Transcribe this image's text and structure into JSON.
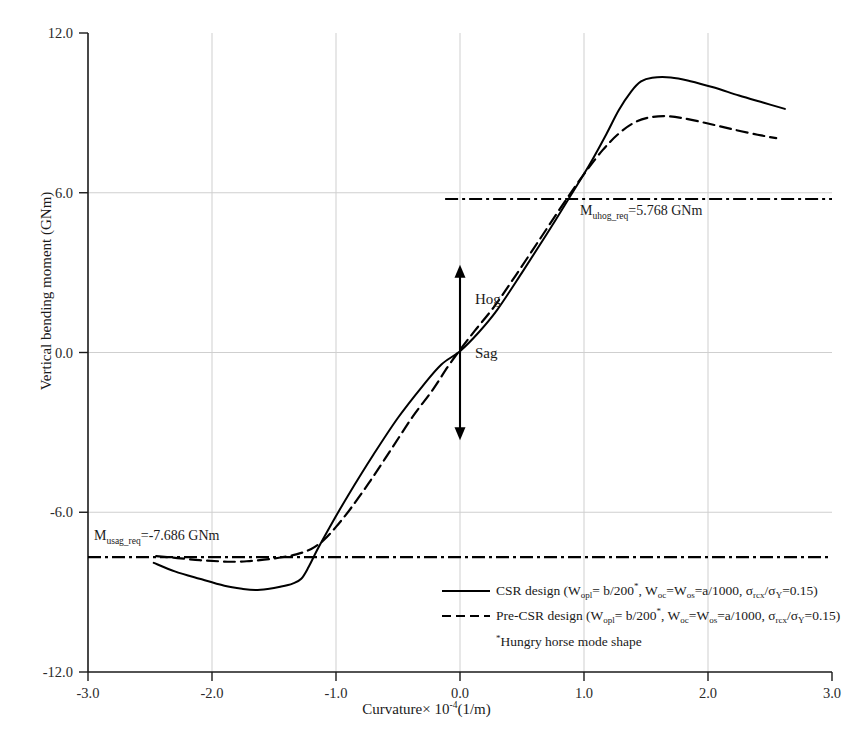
{
  "chart_data": {
    "type": "line",
    "title": "",
    "xlabel": "Curvature× 10⁻⁴(1/m)",
    "ylabel": "Vertical bending moment  (GNm)",
    "xlim": [
      -3.0,
      3.0
    ],
    "ylim": [
      -12.0,
      12.0
    ],
    "xticks": [
      -3.0,
      -2.0,
      -1.0,
      0.0,
      1.0,
      2.0,
      3.0
    ],
    "xticklabels": [
      "-3.0",
      "-2.0",
      "-1.0",
      "0.0",
      "1.0",
      "2.0",
      "3.0"
    ],
    "yticks": [
      12.0,
      6.0,
      0.0,
      -6.0,
      -12.0
    ],
    "yticklabels": [
      "12.0",
      "6.0",
      "0.0",
      "-6.0",
      "-12.0"
    ],
    "grid": true,
    "legend_position": "lower-right-inside",
    "series": [
      {
        "name": "CSR design",
        "style": "solid",
        "color": "#000000",
        "points": [
          [
            -2.47,
            -7.9
          ],
          [
            -2.3,
            -8.22
          ],
          [
            -2.1,
            -8.5
          ],
          [
            -1.9,
            -8.76
          ],
          [
            -1.75,
            -8.88
          ],
          [
            -1.65,
            -8.92
          ],
          [
            -1.55,
            -8.88
          ],
          [
            -1.45,
            -8.8
          ],
          [
            -1.35,
            -8.68
          ],
          [
            -1.28,
            -8.5
          ],
          [
            -1.22,
            -8.05
          ],
          [
            -1.15,
            -7.4
          ],
          [
            -1.05,
            -6.55
          ],
          [
            -0.9,
            -5.35
          ],
          [
            -0.7,
            -3.85
          ],
          [
            -0.5,
            -2.45
          ],
          [
            -0.3,
            -1.25
          ],
          [
            -0.15,
            -0.45
          ],
          [
            0.0,
            0.05
          ],
          [
            0.15,
            0.75
          ],
          [
            0.3,
            1.6
          ],
          [
            0.5,
            3.0
          ],
          [
            0.7,
            4.45
          ],
          [
            0.9,
            5.95
          ],
          [
            1.05,
            7.1
          ],
          [
            1.18,
            8.2
          ],
          [
            1.28,
            9.1
          ],
          [
            1.38,
            9.8
          ],
          [
            1.46,
            10.18
          ],
          [
            1.55,
            10.32
          ],
          [
            1.7,
            10.33
          ],
          [
            1.85,
            10.2
          ],
          [
            2.05,
            9.95
          ],
          [
            2.25,
            9.65
          ],
          [
            2.45,
            9.38
          ],
          [
            2.62,
            9.15
          ]
        ]
      },
      {
        "name": "Pre-CSR design",
        "style": "dashed",
        "color": "#000000",
        "points": [
          [
            -2.45,
            -7.65
          ],
          [
            -2.28,
            -7.72
          ],
          [
            -2.1,
            -7.8
          ],
          [
            -1.95,
            -7.84
          ],
          [
            -1.85,
            -7.86
          ],
          [
            -1.72,
            -7.84
          ],
          [
            -1.58,
            -7.78
          ],
          [
            -1.45,
            -7.7
          ],
          [
            -1.32,
            -7.58
          ],
          [
            -1.2,
            -7.38
          ],
          [
            -1.1,
            -7.05
          ],
          [
            -1.0,
            -6.55
          ],
          [
            -0.88,
            -5.85
          ],
          [
            -0.72,
            -4.8
          ],
          [
            -0.55,
            -3.6
          ],
          [
            -0.38,
            -2.4
          ],
          [
            -0.22,
            -1.4
          ],
          [
            -0.1,
            -0.55
          ],
          [
            0.0,
            0.1
          ],
          [
            0.12,
            0.82
          ],
          [
            0.28,
            1.75
          ],
          [
            0.45,
            2.9
          ],
          [
            0.65,
            4.3
          ],
          [
            0.85,
            5.7
          ],
          [
            1.0,
            6.7
          ],
          [
            1.15,
            7.6
          ],
          [
            1.28,
            8.22
          ],
          [
            1.4,
            8.62
          ],
          [
            1.52,
            8.82
          ],
          [
            1.65,
            8.88
          ],
          [
            1.8,
            8.8
          ],
          [
            2.0,
            8.6
          ],
          [
            2.2,
            8.38
          ],
          [
            2.4,
            8.18
          ],
          [
            2.55,
            8.05
          ]
        ]
      }
    ],
    "reference_lines": [
      {
        "name": "M_uhog_req",
        "value": 5.768,
        "label": "M",
        "label_sub": "uhog_req",
        "label_rest": "=5.768 GNm",
        "style": "dash-dot",
        "x_start": -0.12,
        "x_end": 3.0
      },
      {
        "name": "M_usag_req",
        "value": -7.686,
        "label": "M",
        "label_sub": "usag_req",
        "label_rest": "=-7.686 GNm",
        "style": "dash-dot",
        "x_start": -3.0,
        "x_end": 3.0
      }
    ],
    "annotations": [
      {
        "name": "hog-label",
        "text": "Hog",
        "x": 0.18,
        "y": 1.85
      },
      {
        "name": "sag-label",
        "text": "Sag",
        "x": 0.18,
        "y": -1.3
      },
      {
        "name": "hog-sag-arrow",
        "text": "",
        "x": 0.0,
        "y_top": 3.3,
        "y_bottom": -3.3
      }
    ]
  },
  "legend": {
    "items": [
      {
        "style": "solid",
        "prefix": "CSR design (",
        "w1": "W",
        "w1_sub": "opl",
        "seg1": "= b/200",
        "star1": "*",
        "seg2": ", ",
        "w2": "W",
        "w2_sub": "oc",
        "eq1": "=",
        "w3": "W",
        "w3_sub": "os",
        "seg3": "=a/1000, ",
        "s1": "σ",
        "s1_sub": "rcx",
        "slash": "/",
        "s2": "σ",
        "s2_sub": "Y",
        "tail": "=0.15)"
      },
      {
        "style": "dashed",
        "prefix": "Pre-CSR design (",
        "w1": "W",
        "w1_sub": "opl",
        "seg1": "= b/200",
        "star1": "*",
        "seg2": ", ",
        "w2": "W",
        "w2_sub": "oc",
        "eq1": "=",
        "w3": "W",
        "w3_sub": "os",
        "seg3": "=a/1000, ",
        "s1": "σ",
        "s1_sub": "rcx",
        "slash": "/",
        "s2": "σ",
        "s2_sub": "Y",
        "tail": "=0.15)"
      }
    ],
    "footnote_star": "*",
    "footnote": "Hungry horse mode shape"
  },
  "axis": {
    "xlabel_main": "Curvature",
    "xlabel_times": "×",
    "xlabel_base": " 10",
    "xlabel_exp": "-4",
    "xlabel_unit": "(1/m)",
    "ylabel": "Vertical bending moment  (GNm)"
  },
  "colors": {
    "axis": "#1a1a1a",
    "grid": "#cfcfcf",
    "curve": "#000000",
    "text": "#1a1a1a"
  }
}
